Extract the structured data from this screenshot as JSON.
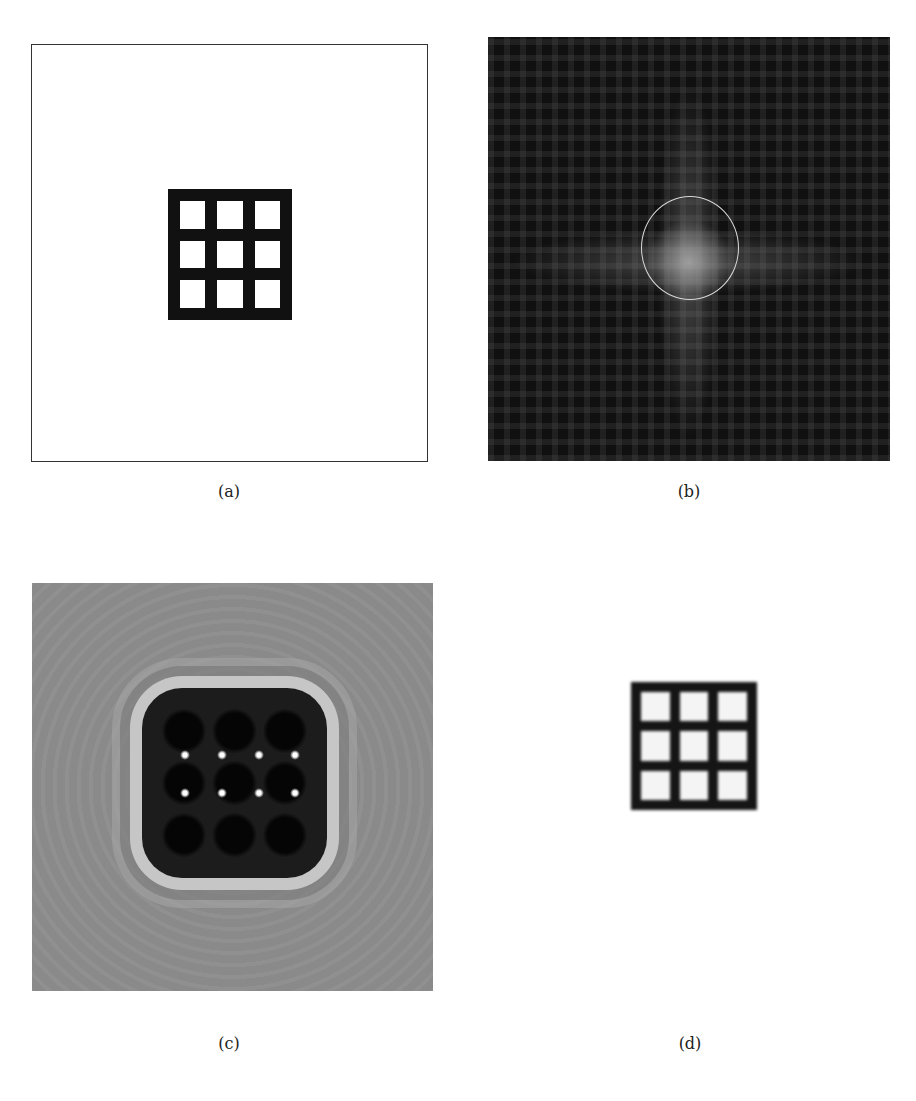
{
  "figure": {
    "panels": [
      {
        "id": "a",
        "caption": "(a)",
        "description": "Original object: 3x3 grid of white squares within black frame on white background",
        "frame_color": "#333333",
        "grid": {
          "rows": 3,
          "cols": 3
        }
      },
      {
        "id": "b",
        "caption": "(b)",
        "description": "Fourier magnitude (diffraction pattern) on dark background with circular low-pass mask",
        "mask": "circle",
        "mask_color": "#d8d8d8"
      },
      {
        "id": "c",
        "caption": "(c)",
        "description": "Reconstruction with ringing artifacts on noisy gray background",
        "grid": {
          "rows": 3,
          "cols": 3
        }
      },
      {
        "id": "d",
        "caption": "(d)",
        "description": "Blurred reconstruction of the 3x3 grid on white background",
        "grid": {
          "rows": 3,
          "cols": 3
        }
      }
    ]
  }
}
